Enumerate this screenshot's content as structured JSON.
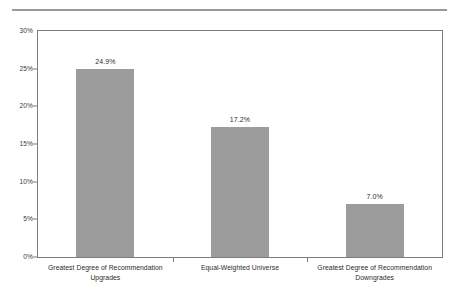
{
  "chart_data": {
    "type": "bar",
    "title": "",
    "subtitle": "",
    "xlabel": "",
    "ylabel": "",
    "categories": [
      "Greatest Degree of Recommendation Upgrades",
      "Equal-Weighted Universe",
      "Greatest Degree of Recommendation Downgrades"
    ],
    "category_lines": [
      [
        "Greatest Degree of Recommendation",
        "Upgrades"
      ],
      [
        "Equal-Weighted Universe"
      ],
      [
        "Greatest Degree of Recommendation",
        "Downgrades"
      ]
    ],
    "values": [
      24.9,
      17.2,
      7.0
    ],
    "value_labels": [
      "24.9%",
      "17.2%",
      "7.0%"
    ],
    "ylim": [
      0,
      30
    ],
    "ytick_values": [
      30,
      25,
      20,
      15,
      10,
      5,
      0
    ],
    "ytick_labels": [
      "30%",
      "25%",
      "20%",
      "15%",
      "10%",
      "5%",
      "0%"
    ],
    "grid": false,
    "legend": null,
    "bar_color": "#9c9c9c",
    "axis_color": "#7d7d7d",
    "rule_color": "#9a9a9a",
    "text_color": "#2b2b2b",
    "background": "#ffffff"
  }
}
